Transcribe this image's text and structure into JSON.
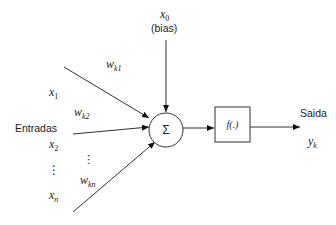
{
  "diagram": {
    "inputs_label": "Entradas",
    "output_label": "Saida",
    "bias": {
      "symbol": "x",
      "subscript": "0",
      "label": "(bias)"
    },
    "inputs": [
      {
        "symbol": "x",
        "subscript": "1"
      },
      {
        "symbol": "x",
        "subscript": "2"
      },
      {
        "symbol": "x",
        "subscript": "n"
      }
    ],
    "weights": [
      {
        "symbol": "w",
        "subscript": "k1"
      },
      {
        "symbol": "w",
        "subscript": "k2"
      },
      {
        "symbol": "w",
        "subscript": "kn"
      }
    ],
    "ellipsis_vertical": "⋮",
    "ellipsis_weights": "⋮",
    "summation_symbol": "Σ",
    "activation_function": "f(.)",
    "output": {
      "symbol": "y",
      "subscript": "k"
    }
  }
}
